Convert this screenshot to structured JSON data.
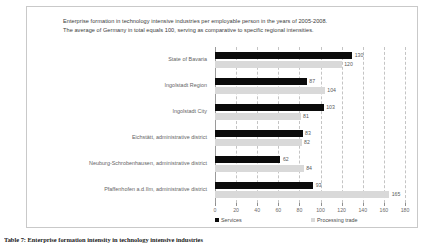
{
  "chart_data": {
    "type": "bar",
    "orientation": "horizontal",
    "title_lines": [
      "Enterprise formation  in technology intensive industries per employable person in the years of  2005-2008.",
      "The average of Germany  in total equals 100, serving as comparative to specific regional intensities."
    ],
    "categories": [
      "State of Bavaria",
      "Ingolstadt Region",
      "Ingolstadt City",
      "Eichstätt, administrative district",
      "Neuburg-Schrobenhausen, administrative district",
      "Pfaffenhofen a.d.Ilm, administrative district"
    ],
    "series": [
      {
        "name": "Services",
        "color": "#0b0b0b",
        "values": [
          130,
          87,
          103,
          83,
          62,
          93
        ]
      },
      {
        "name": "Processing trade",
        "color": "#d9d9d9",
        "values": [
          120,
          104,
          81,
          82,
          84,
          165
        ]
      }
    ],
    "xlabel": "",
    "ylabel": "",
    "xlim": [
      0,
      180
    ],
    "xticks": [
      0,
      20,
      40,
      60,
      80,
      100,
      120,
      140,
      160,
      180
    ],
    "xtick_labels": [
      "0",
      "20",
      "40",
      "60",
      "80",
      "100",
      "120",
      "140",
      "160",
      "180"
    ],
    "grid": true,
    "grid_axis": "x",
    "legend_position": "bottom"
  },
  "caption": {
    "text": "Table 7: Enterprise formation intensity in technology intensive industries"
  }
}
